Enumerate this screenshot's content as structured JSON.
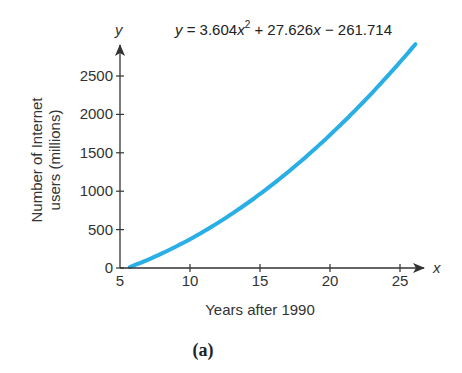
{
  "chart_data": {
    "type": "line",
    "title": "",
    "equation": {
      "lhs": "y",
      "eq": " = ",
      "a": "3.604",
      "x2": "x",
      "sup": "2",
      "plus": " + ",
      "b": "27.626",
      "x1": "x",
      "minus": " − ",
      "c": "261.714"
    },
    "coefficients": {
      "a": 3.604,
      "b": 27.626,
      "c": -261.714
    },
    "xlabel": "Years after 1990",
    "ylabel_line1": "Number of Internet",
    "ylabel_line2": "users (millions)",
    "x_var": "x",
    "y_var": "y",
    "xlim": [
      5,
      26.5
    ],
    "ylim": [
      0,
      2900
    ],
    "x_ticks": [
      5,
      10,
      15,
      20,
      25
    ],
    "x_tick_labels": [
      "5",
      "10",
      "15",
      "20",
      "25"
    ],
    "y_ticks": [
      0,
      500,
      1000,
      1500,
      2000,
      2500
    ],
    "y_tick_labels": [
      "0",
      "500",
      "1000",
      "1500",
      "2000",
      "2500"
    ],
    "grid": false,
    "legend": "none",
    "series": [
      {
        "name": "y = 3.604x^2 + 27.626x - 261.714",
        "color": "#29aee6",
        "x": [
          5.7,
          8,
          10,
          12,
          14,
          16,
          18,
          20,
          22,
          24,
          26.1
        ],
        "y": [
          0,
          92,
          377,
          520,
          812,
          1108,
          1423,
          1733,
          2092,
          2460,
          2897
        ]
      }
    ],
    "caption": "(a)"
  }
}
